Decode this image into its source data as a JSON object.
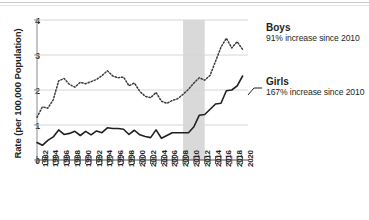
{
  "chart_data": {
    "type": "line",
    "title": "",
    "xlabel": "",
    "ylabel": "Rate (per 100,000 Population)",
    "ylim": [
      0,
      4
    ],
    "yticks": [
      0,
      1,
      2,
      3,
      4
    ],
    "xlim": [
      1982,
      2021
    ],
    "xticks": [
      1982,
      1984,
      1986,
      1988,
      1990,
      1992,
      1994,
      1996,
      1998,
      2000,
      2002,
      2004,
      2006,
      2008,
      2010,
      2012,
      2014,
      2016,
      2018,
      2020
    ],
    "xtick_labels": [
      "1982",
      "1984",
      "1986",
      "1988",
      "1990",
      "1992",
      "1994",
      "1996",
      "1998",
      "2000",
      "2002",
      "2004",
      "2006",
      "2008",
      "2010",
      "2012",
      "2014",
      "2016",
      "2018",
      "2020"
    ],
    "grid": "horizontal",
    "legend": "inline-annotations",
    "x": [
      1982,
      1983,
      1984,
      1985,
      1986,
      1987,
      1988,
      1989,
      1990,
      1991,
      1992,
      1993,
      1994,
      1995,
      1996,
      1997,
      1998,
      1999,
      2000,
      2001,
      2002,
      2003,
      2004,
      2005,
      2006,
      2007,
      2008,
      2009,
      2010,
      2011,
      2012,
      2013,
      2014,
      2015,
      2016,
      2017,
      2018,
      2019,
      2020
    ],
    "series": [
      {
        "name": "Boys",
        "style": "dotted",
        "color": "#3b3b3b",
        "values": [
          1.22,
          1.52,
          1.48,
          1.72,
          2.26,
          2.33,
          2.16,
          2.08,
          2.22,
          2.18,
          2.24,
          2.3,
          2.41,
          2.55,
          2.4,
          2.35,
          2.37,
          2.12,
          2.2,
          1.96,
          1.82,
          1.78,
          1.93,
          1.68,
          1.62,
          1.7,
          1.75,
          1.88,
          2.02,
          2.2,
          2.35,
          2.28,
          2.42,
          2.82,
          3.22,
          3.48,
          3.2,
          3.38,
          3.16
        ]
      },
      {
        "name": "Girls",
        "style": "solid",
        "color": "#231f20",
        "values": [
          0.5,
          0.42,
          0.56,
          0.66,
          0.86,
          0.73,
          0.76,
          0.82,
          0.7,
          0.82,
          0.72,
          0.83,
          0.78,
          0.92,
          0.9,
          0.9,
          0.88,
          0.73,
          0.85,
          0.72,
          0.67,
          0.64,
          0.86,
          0.62,
          0.7,
          0.78,
          0.78,
          0.78,
          0.78,
          0.95,
          1.28,
          1.3,
          1.45,
          1.6,
          1.62,
          1.98,
          2.0,
          2.12,
          2.4
        ]
      }
    ],
    "shaded_band": {
      "label": "",
      "x_start": 2009,
      "x_end": 2013,
      "color": "#d9d9d9"
    },
    "annotations": [
      {
        "id": "boys",
        "title": "Boys",
        "subtitle": "91% increase since 2010"
      },
      {
        "id": "girls",
        "title": "Girls",
        "subtitle": "167% increase since 2010"
      }
    ]
  },
  "axis": {
    "y_ticks": [
      "0",
      "1",
      "2",
      "3",
      "4"
    ],
    "y_title": "Rate (per 100,000 Population)"
  }
}
